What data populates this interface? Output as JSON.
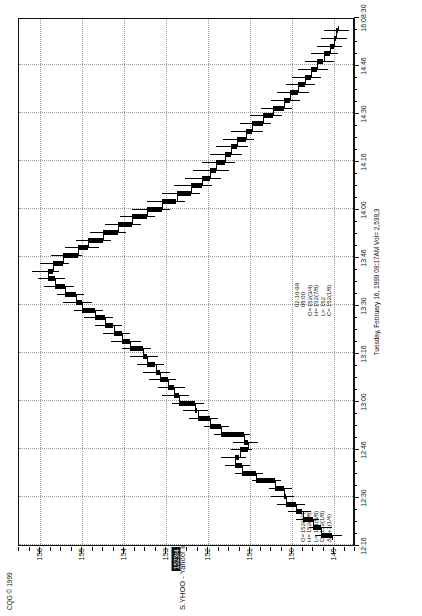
{
  "meta": {
    "copyright": "CQG © 1999",
    "title": "S.YHOO - Yahoo! Inc., 2 Min (Delayed by 15 mins)",
    "datestamp": "Tuesday, February 16, 1999  08:17AM  Vol= 2,538,3",
    "last_price_tag": "1523r4"
  },
  "quote_left": {
    "rows": [
      {
        "label": "O=",
        "value": "152(3/4)"
      },
      {
        "label": "H=",
        "value": "152(7/8)"
      },
      {
        "label": "L=",
        "value": "151(5/8)"
      },
      {
        "label": "C=",
        "value": "152(1/8)"
      },
      {
        "label": "Δ=",
        "value": "+1(1/4)"
      }
    ]
  },
  "quote_right": {
    "rows": [
      {
        "label": "",
        "value": "02-16-99"
      },
      {
        "label": "",
        "value": "08:00"
      },
      {
        "label": "O=",
        "value": "152(3/4)"
      },
      {
        "label": "H=",
        "value": "152(7/8)"
      },
      {
        "label": "L=",
        "value": "152"
      },
      {
        "label": "C=",
        "value": "152(1/8)"
      }
    ]
  },
  "chart_data": {
    "type": "ohlc-bar",
    "title": "S.YHOO - Yahoo! Inc., 2 Min (Delayed by 15 mins)",
    "subtitle": "Tuesday, February 16, 1999  08:17AM  Vol= 2,538,3",
    "xlabel": "",
    "ylabel": "Price",
    "ylim": [
      148.5,
      156.5
    ],
    "yticks": [
      156,
      155,
      154,
      153,
      152,
      151,
      150,
      149
    ],
    "ytick_labels": [
      "156",
      "155",
      "154",
      "153",
      "152",
      "151",
      "150",
      "149"
    ],
    "xlim": [
      "12:16",
      "16:08:30"
    ],
    "xticks": [
      "12:16",
      "12:30",
      "12:46",
      "13:00",
      "13:16",
      "13:30",
      "13:46",
      "14:00",
      "14:16",
      "14:30",
      "14:46",
      "16:08:30"
    ],
    "grid": true,
    "legend": false,
    "price_marker": 152.75,
    "bars": [
      {
        "t": 0,
        "o": 149.05,
        "h": 149.45,
        "l": 148.8,
        "c": 149.3
      },
      {
        "t": 1,
        "o": 149.3,
        "h": 149.6,
        "l": 149.05,
        "c": 149.5
      },
      {
        "t": 2,
        "o": 149.5,
        "h": 149.9,
        "l": 149.35,
        "c": 149.75
      },
      {
        "t": 3,
        "o": 149.75,
        "h": 150.1,
        "l": 149.55,
        "c": 149.9
      },
      {
        "t": 4,
        "o": 149.9,
        "h": 150.35,
        "l": 149.7,
        "c": 150.15
      },
      {
        "t": 5,
        "o": 150.15,
        "h": 150.5,
        "l": 149.95,
        "c": 150.2
      },
      {
        "t": 6,
        "o": 150.2,
        "h": 150.55,
        "l": 150.0,
        "c": 150.4
      },
      {
        "t": 7,
        "o": 150.4,
        "h": 150.95,
        "l": 150.25,
        "c": 150.85
      },
      {
        "t": 8,
        "o": 150.85,
        "h": 151.35,
        "l": 150.7,
        "c": 151.2
      },
      {
        "t": 9,
        "o": 151.2,
        "h": 151.6,
        "l": 151.0,
        "c": 151.35
      },
      {
        "t": 10,
        "o": 151.35,
        "h": 151.7,
        "l": 151.1,
        "c": 151.25
      },
      {
        "t": 11,
        "o": 151.25,
        "h": 151.45,
        "l": 150.95,
        "c": 151.05
      },
      {
        "t": 12,
        "o": 151.05,
        "h": 151.4,
        "l": 150.8,
        "c": 151.15
      },
      {
        "t": 13,
        "o": 151.15,
        "h": 151.85,
        "l": 151.0,
        "c": 151.7
      },
      {
        "t": 14,
        "o": 151.7,
        "h": 152.1,
        "l": 151.5,
        "c": 151.95
      },
      {
        "t": 15,
        "o": 151.95,
        "h": 152.45,
        "l": 151.75,
        "c": 152.25
      },
      {
        "t": 16,
        "o": 152.25,
        "h": 152.6,
        "l": 152.0,
        "c": 152.3
      },
      {
        "t": 17,
        "o": 152.3,
        "h": 152.85,
        "l": 152.1,
        "c": 152.7
      },
      {
        "t": 18,
        "o": 152.7,
        "h": 153.1,
        "l": 152.45,
        "c": 152.8
      },
      {
        "t": 19,
        "o": 152.8,
        "h": 153.2,
        "l": 152.55,
        "c": 152.95
      },
      {
        "t": 20,
        "o": 152.95,
        "h": 153.4,
        "l": 152.75,
        "c": 153.15
      },
      {
        "t": 21,
        "o": 153.15,
        "h": 153.55,
        "l": 152.9,
        "c": 153.25
      },
      {
        "t": 22,
        "o": 153.25,
        "h": 153.7,
        "l": 153.05,
        "c": 153.45
      },
      {
        "t": 23,
        "o": 153.45,
        "h": 153.85,
        "l": 153.2,
        "c": 153.55
      },
      {
        "t": 24,
        "o": 153.55,
        "h": 154.05,
        "l": 153.35,
        "c": 153.85
      },
      {
        "t": 25,
        "o": 153.85,
        "h": 154.3,
        "l": 153.6,
        "c": 154.05
      },
      {
        "t": 26,
        "o": 154.05,
        "h": 154.5,
        "l": 153.85,
        "c": 154.25
      },
      {
        "t": 27,
        "o": 154.25,
        "h": 154.7,
        "l": 154.05,
        "c": 154.45
      },
      {
        "t": 28,
        "o": 154.45,
        "h": 154.95,
        "l": 154.25,
        "c": 154.7
      },
      {
        "t": 29,
        "o": 154.7,
        "h": 155.2,
        "l": 154.5,
        "c": 155.0
      },
      {
        "t": 30,
        "o": 155.0,
        "h": 155.45,
        "l": 154.75,
        "c": 155.15
      },
      {
        "t": 31,
        "o": 155.15,
        "h": 155.6,
        "l": 154.95,
        "c": 155.4
      },
      {
        "t": 32,
        "o": 155.4,
        "h": 155.9,
        "l": 155.2,
        "c": 155.65
      },
      {
        "t": 33,
        "o": 155.65,
        "h": 156.05,
        "l": 155.4,
        "c": 155.8
      },
      {
        "t": 34,
        "o": 155.8,
        "h": 156.2,
        "l": 155.55,
        "c": 155.7
      },
      {
        "t": 35,
        "o": 155.7,
        "h": 156.0,
        "l": 155.3,
        "c": 155.45
      },
      {
        "t": 36,
        "o": 155.45,
        "h": 155.75,
        "l": 155.0,
        "c": 155.1
      },
      {
        "t": 37,
        "o": 155.1,
        "h": 155.4,
        "l": 154.6,
        "c": 154.85
      },
      {
        "t": 38,
        "o": 154.85,
        "h": 155.15,
        "l": 154.3,
        "c": 154.5
      },
      {
        "t": 39,
        "o": 154.5,
        "h": 154.8,
        "l": 153.95,
        "c": 154.15
      },
      {
        "t": 40,
        "o": 154.15,
        "h": 154.45,
        "l": 153.6,
        "c": 153.8
      },
      {
        "t": 41,
        "o": 153.8,
        "h": 154.1,
        "l": 153.25,
        "c": 153.45
      },
      {
        "t": 42,
        "o": 153.45,
        "h": 153.8,
        "l": 152.9,
        "c": 153.1
      },
      {
        "t": 43,
        "o": 153.1,
        "h": 153.45,
        "l": 152.55,
        "c": 152.75
      },
      {
        "t": 44,
        "o": 152.75,
        "h": 153.1,
        "l": 152.2,
        "c": 152.4
      },
      {
        "t": 45,
        "o": 152.4,
        "h": 152.8,
        "l": 151.9,
        "c": 152.15
      },
      {
        "t": 46,
        "o": 152.15,
        "h": 152.55,
        "l": 151.7,
        "c": 151.95
      },
      {
        "t": 47,
        "o": 151.95,
        "h": 152.35,
        "l": 151.5,
        "c": 151.8
      },
      {
        "t": 48,
        "o": 151.8,
        "h": 152.15,
        "l": 151.35,
        "c": 151.6
      },
      {
        "t": 49,
        "o": 151.6,
        "h": 151.95,
        "l": 151.2,
        "c": 151.45
      },
      {
        "t": 50,
        "o": 151.45,
        "h": 151.8,
        "l": 151.05,
        "c": 151.3
      },
      {
        "t": 51,
        "o": 151.3,
        "h": 151.65,
        "l": 150.9,
        "c": 151.1
      },
      {
        "t": 52,
        "o": 151.1,
        "h": 151.45,
        "l": 150.7,
        "c": 150.95
      },
      {
        "t": 53,
        "o": 150.95,
        "h": 151.25,
        "l": 150.5,
        "c": 150.7
      },
      {
        "t": 54,
        "o": 150.7,
        "h": 151.0,
        "l": 150.25,
        "c": 150.45
      },
      {
        "t": 55,
        "o": 150.45,
        "h": 150.75,
        "l": 150.0,
        "c": 150.2
      },
      {
        "t": 56,
        "o": 150.2,
        "h": 150.5,
        "l": 149.8,
        "c": 150.05
      },
      {
        "t": 57,
        "o": 150.05,
        "h": 150.35,
        "l": 149.6,
        "c": 149.85
      },
      {
        "t": 58,
        "o": 149.85,
        "h": 150.15,
        "l": 149.45,
        "c": 149.7
      },
      {
        "t": 59,
        "o": 149.7,
        "h": 150.0,
        "l": 149.3,
        "c": 149.55
      },
      {
        "t": 60,
        "o": 149.55,
        "h": 149.85,
        "l": 149.15,
        "c": 149.4
      },
      {
        "t": 61,
        "o": 149.4,
        "h": 149.7,
        "l": 149.0,
        "c": 149.25
      },
      {
        "t": 62,
        "o": 149.25,
        "h": 149.55,
        "l": 148.9,
        "c": 149.1
      },
      {
        "t": 63,
        "o": 149.1,
        "h": 149.4,
        "l": 148.8,
        "c": 149.0
      },
      {
        "t": 64,
        "o": 149.0,
        "h": 149.3,
        "l": 148.7,
        "c": 148.95
      },
      {
        "t": 65,
        "o": 148.95,
        "h": 149.25,
        "l": 148.65,
        "c": 148.9
      }
    ]
  }
}
